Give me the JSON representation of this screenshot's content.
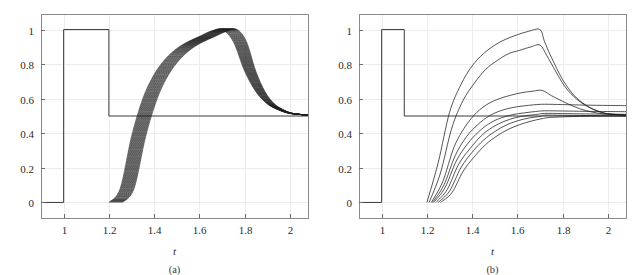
{
  "figure": {
    "background": "#ffffff",
    "width": 637,
    "height": 275
  },
  "panels": [
    {
      "id": "a",
      "caption": "(a)",
      "chart_data": {
        "type": "line",
        "title": "",
        "xlabel": "t",
        "ylabel": "",
        "xlim": [
          0.9,
          2.08
        ],
        "ylim": [
          -0.09,
          1.09
        ],
        "xticks": [
          1,
          1.2,
          1.4,
          1.6,
          1.8,
          2
        ],
        "xtick_labels": [
          "1",
          "1.2",
          "1.4",
          "1.6",
          "1.8",
          "2"
        ],
        "yticks": [
          0,
          0.2,
          0.4,
          0.6,
          0.8,
          1
        ],
        "ytick_labels": [
          "0",
          "0.2",
          "0.4",
          "0.6",
          "0.8",
          "1"
        ],
        "grid": true,
        "legend": "none",
        "series": [
          {
            "name": "input-pulse",
            "kind": "step",
            "x": [
              0.9,
              1.0,
              1.0,
              1.2,
              1.2,
              2.08
            ],
            "values": [
              0,
              0,
              1,
              1,
              0.5,
              0.5
            ]
          },
          {
            "name": "response-band",
            "kind": "family",
            "count": 22,
            "description": "Family of delayed sigmoidal responses rising from 0 near t=1.20-1.26 to 1.0 near t=1.68-1.75, then decaying toward 0.5",
            "rise_start_first": 1.2,
            "rise_start_last": 1.26,
            "peak_t_first": 1.68,
            "peak_t_last": 1.75,
            "peak_value": 1.0,
            "decay_floor": 0.505,
            "x": [
              1.2,
              1.25,
              1.3,
              1.35,
              1.4,
              1.45,
              1.5,
              1.55,
              1.6,
              1.65,
              1.7,
              1.75,
              1.8,
              1.85,
              1.9,
              1.95,
              2.0,
              2.08
            ],
            "values": [
              0.0,
              0.08,
              0.38,
              0.6,
              0.74,
              0.83,
              0.89,
              0.93,
              0.96,
              0.99,
              1.0,
              0.93,
              0.76,
              0.64,
              0.57,
              0.535,
              0.515,
              0.505
            ]
          }
        ]
      }
    },
    {
      "id": "b",
      "caption": "(b)",
      "chart_data": {
        "type": "line",
        "title": "",
        "xlabel": "t",
        "ylabel": "",
        "xlim": [
          0.9,
          2.08
        ],
        "ylim": [
          -0.09,
          1.09
        ],
        "xticks": [
          1,
          1.2,
          1.4,
          1.6,
          1.8,
          2
        ],
        "xtick_labels": [
          "1",
          "1.2",
          "1.4",
          "1.6",
          "1.8",
          "2"
        ],
        "yticks": [
          0,
          0.2,
          0.4,
          0.6,
          0.8,
          1
        ],
        "ytick_labels": [
          "0",
          "0.2",
          "0.4",
          "0.6",
          "0.8",
          "1"
        ],
        "grid": true,
        "legend": "none",
        "series": [
          {
            "name": "input-pulse",
            "kind": "step",
            "x": [
              0.9,
              1.0,
              1.0,
              1.1,
              1.1,
              2.08
            ],
            "values": [
              0,
              0,
              1,
              1,
              0.5,
              0.5
            ]
          },
          {
            "name": "response-1",
            "kind": "line",
            "plateau": 1.0,
            "rise_start": 1.2,
            "break_t": 1.7,
            "x": [
              1.2,
              1.25,
              1.3,
              1.35,
              1.4,
              1.45,
              1.5,
              1.55,
              1.6,
              1.65,
              1.7,
              1.72,
              1.75,
              1.8,
              1.85,
              1.9,
              1.95,
              2.0,
              2.08
            ],
            "values": [
              0.0,
              0.23,
              0.52,
              0.68,
              0.79,
              0.86,
              0.91,
              0.945,
              0.97,
              0.99,
              1.0,
              0.93,
              0.84,
              0.71,
              0.62,
              0.565,
              0.53,
              0.513,
              0.505
            ]
          },
          {
            "name": "response-2",
            "kind": "line",
            "plateau": 0.91,
            "rise_start": 1.21,
            "break_t": 1.7,
            "x": [
              1.21,
              1.26,
              1.31,
              1.36,
              1.41,
              1.46,
              1.51,
              1.56,
              1.61,
              1.66,
              1.7,
              1.73,
              1.76,
              1.81,
              1.86,
              1.91,
              1.96,
              2.0,
              2.08
            ],
            "values": [
              0.0,
              0.17,
              0.43,
              0.59,
              0.69,
              0.77,
              0.82,
              0.86,
              0.88,
              0.9,
              0.91,
              0.85,
              0.78,
              0.67,
              0.6,
              0.555,
              0.527,
              0.513,
              0.505
            ]
          },
          {
            "name": "response-3",
            "kind": "line",
            "plateau": 0.648,
            "rise_start": 1.22,
            "break_t": 1.71,
            "x": [
              1.22,
              1.27,
              1.32,
              1.37,
              1.42,
              1.47,
              1.52,
              1.57,
              1.62,
              1.67,
              1.71,
              1.75,
              1.8,
              1.85,
              1.9,
              1.95,
              2.0,
              2.08
            ],
            "values": [
              0.0,
              0.12,
              0.32,
              0.44,
              0.52,
              0.57,
              0.6,
              0.62,
              0.635,
              0.644,
              0.648,
              0.618,
              0.585,
              0.555,
              0.532,
              0.518,
              0.51,
              0.505
            ]
          },
          {
            "name": "response-4",
            "kind": "line",
            "plateau": 0.568,
            "rise_start": 1.225,
            "break_t": 1.72,
            "x": [
              1.225,
              1.275,
              1.325,
              1.375,
              1.425,
              1.475,
              1.525,
              1.575,
              1.625,
              1.675,
              1.72,
              1.8,
              1.9,
              2.0,
              2.08
            ],
            "values": [
              0.0,
              0.1,
              0.27,
              0.38,
              0.45,
              0.5,
              0.53,
              0.548,
              0.558,
              0.565,
              0.568,
              0.566,
              0.563,
              0.561,
              0.56
            ]
          },
          {
            "name": "response-5",
            "kind": "line",
            "plateau": 0.53,
            "rise_start": 1.23,
            "break_t": 1.72,
            "x": [
              1.23,
              1.28,
              1.33,
              1.38,
              1.43,
              1.48,
              1.53,
              1.58,
              1.63,
              1.68,
              1.72,
              1.8,
              1.9,
              2.0,
              2.08
            ],
            "values": [
              0.0,
              0.085,
              0.24,
              0.34,
              0.41,
              0.46,
              0.49,
              0.508,
              0.518,
              0.526,
              0.53,
              0.529,
              0.527,
              0.526,
              0.525
            ]
          },
          {
            "name": "response-6",
            "kind": "line",
            "plateau": 0.515,
            "rise_start": 1.24,
            "break_t": 1.72,
            "x": [
              1.24,
              1.29,
              1.34,
              1.39,
              1.44,
              1.49,
              1.54,
              1.59,
              1.64,
              1.69,
              1.72,
              1.8,
              1.9,
              2.0,
              2.08
            ],
            "values": [
              0.0,
              0.075,
              0.22,
              0.31,
              0.385,
              0.435,
              0.468,
              0.49,
              0.502,
              0.51,
              0.515,
              0.514,
              0.512,
              0.511,
              0.51
            ]
          },
          {
            "name": "response-7",
            "kind": "line",
            "plateau": 0.505,
            "rise_start": 1.25,
            "break_t": 1.72,
            "x": [
              1.25,
              1.3,
              1.35,
              1.4,
              1.45,
              1.5,
              1.55,
              1.6,
              1.65,
              1.7,
              1.72,
              1.8,
              1.9,
              2.0,
              2.08
            ],
            "values": [
              0.0,
              0.065,
              0.2,
              0.29,
              0.36,
              0.41,
              0.447,
              0.472,
              0.488,
              0.498,
              0.505,
              0.504,
              0.503,
              0.502,
              0.5
            ]
          },
          {
            "name": "response-8",
            "kind": "line",
            "plateau": 0.5,
            "rise_start": 1.26,
            "break_t": 1.72,
            "x": [
              1.26,
              1.31,
              1.36,
              1.41,
              1.46,
              1.51,
              1.56,
              1.61,
              1.66,
              1.71,
              1.75,
              1.85,
              1.95,
              2.08
            ],
            "values": [
              0.0,
              0.055,
              0.18,
              0.265,
              0.335,
              0.385,
              0.423,
              0.45,
              0.47,
              0.485,
              0.492,
              0.497,
              0.499,
              0.5
            ]
          }
        ]
      }
    }
  ]
}
